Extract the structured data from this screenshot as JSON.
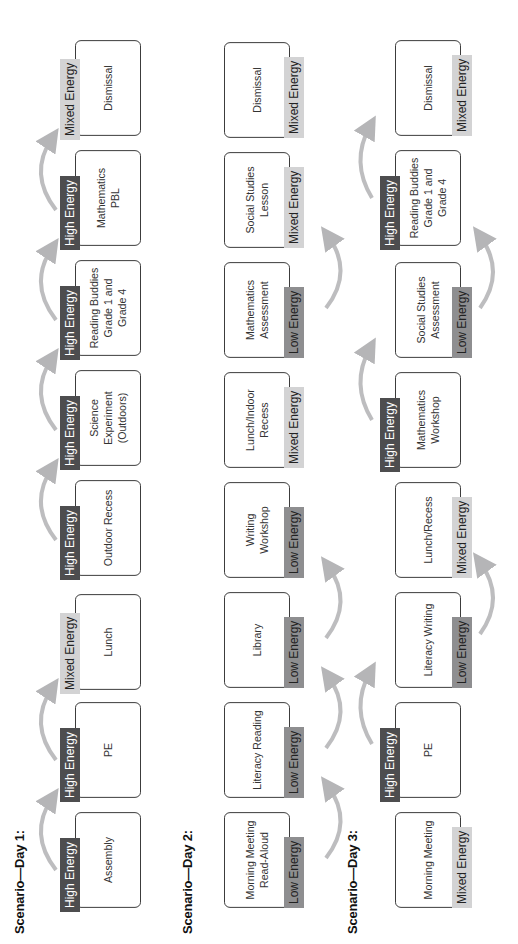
{
  "orientation": "rotated -90deg (text reads bottom-to-top)",
  "legend_colors": {
    "high": "#4d4d4f",
    "low": "#8e8e90",
    "mixed": "#d3d3d4"
  },
  "days": [
    {
      "title": "Scenario—Day 1:",
      "activities": [
        {
          "label": "Assembly",
          "energy": "High Energy"
        },
        {
          "label": "PE",
          "energy": "High Energy"
        },
        {
          "label": "Lunch",
          "energy": "Mixed Energy"
        },
        {
          "label": "Outdoor Recess",
          "energy": "High Energy"
        },
        {
          "label": "Science Experiment (Outdoors)",
          "energy": "High Energy"
        },
        {
          "label": "Reading Buddies Grade 1 and Grade 4",
          "energy": "High Energy"
        },
        {
          "label": "Mathematics PBL",
          "energy": "High Energy"
        },
        {
          "label": "Dismissal",
          "energy": "Mixed Energy"
        }
      ]
    },
    {
      "title": "Scenario—Day 2:",
      "activities": [
        {
          "label": "Morning Meeting Read-Aloud",
          "energy": "Low Energy"
        },
        {
          "label": "Literacy Reading",
          "energy": "Low Energy"
        },
        {
          "label": "Library",
          "energy": "Low Energy"
        },
        {
          "label": "Writing Workshop",
          "energy": "Low Energy"
        },
        {
          "label": "Lunch/Indoor Recess",
          "energy": "Mixed Energy"
        },
        {
          "label": "Mathematics Assessment",
          "energy": "Low Energy"
        },
        {
          "label": "Social Studies Lesson",
          "energy": "Mixed Energy"
        },
        {
          "label": "Dismissal",
          "energy": "Mixed Energy"
        }
      ]
    },
    {
      "title": "Scenario—Day 3:",
      "activities": [
        {
          "label": "Morning Meeting",
          "energy": "Mixed Energy"
        },
        {
          "label": "PE",
          "energy": "High Energy"
        },
        {
          "label": "Literacy Writing",
          "energy": "Low Energy"
        },
        {
          "label": "Lunch/Recess",
          "energy": "Mixed Energy"
        },
        {
          "label": "Mathematics Workshop",
          "energy": "High Energy"
        },
        {
          "label": "Social Studies Assessment",
          "energy": "Low Energy"
        },
        {
          "label": "Reading Buddies Grade 1 and Grade 4",
          "energy": "High Energy"
        },
        {
          "label": "Dismissal",
          "energy": "Mixed Energy"
        }
      ]
    }
  ]
}
